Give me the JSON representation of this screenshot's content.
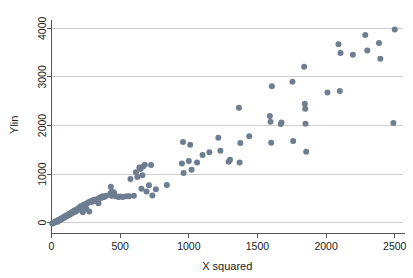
{
  "chart_data": {
    "type": "scatter",
    "title": "",
    "xlabel": "X squared",
    "ylabel": "Ylin",
    "xlim": [
      0,
      2560
    ],
    "ylim": [
      -120,
      4150
    ],
    "xticks": [
      0,
      500,
      1000,
      1500,
      2000,
      2500
    ],
    "yticks": [
      0,
      1000,
      2000,
      3000,
      4000
    ],
    "xtick_labels": [
      "0",
      "500",
      "1000",
      "1500",
      "2000",
      "2500"
    ],
    "ytick_labels": [
      "0",
      "1000",
      "2000",
      "3000",
      "4000"
    ],
    "grid": "horizontal",
    "legend": "none",
    "marker": "filled-circle",
    "marker_color": "#6e7d90",
    "marker_size": 3.0,
    "series": [
      {
        "name": "observations",
        "points": [
          [
            6,
            -15
          ],
          [
            12,
            -5
          ],
          [
            18,
            10
          ],
          [
            22,
            5
          ],
          [
            30,
            25
          ],
          [
            38,
            35
          ],
          [
            45,
            20
          ],
          [
            52,
            60
          ],
          [
            60,
            50
          ],
          [
            68,
            80
          ],
          [
            75,
            70
          ],
          [
            82,
            105
          ],
          [
            90,
            95
          ],
          [
            98,
            130
          ],
          [
            106,
            120
          ],
          [
            115,
            160
          ],
          [
            122,
            150
          ],
          [
            130,
            185
          ],
          [
            138,
            175
          ],
          [
            146,
            215
          ],
          [
            152,
            200
          ],
          [
            160,
            235
          ],
          [
            168,
            250
          ],
          [
            175,
            225
          ],
          [
            182,
            270
          ],
          [
            190,
            255
          ],
          [
            198,
            300
          ],
          [
            205,
            290
          ],
          [
            212,
            340
          ],
          [
            220,
            330
          ],
          [
            228,
            215
          ],
          [
            236,
            370
          ],
          [
            244,
            380
          ],
          [
            252,
            290
          ],
          [
            260,
            395
          ],
          [
            268,
            420
          ],
          [
            275,
            230
          ],
          [
            284,
            440
          ],
          [
            292,
            425
          ],
          [
            300,
            455
          ],
          [
            310,
            470
          ],
          [
            320,
            445
          ],
          [
            330,
            480
          ],
          [
            342,
            400
          ],
          [
            352,
            520
          ],
          [
            362,
            510
          ],
          [
            372,
            545
          ],
          [
            385,
            530
          ],
          [
            398,
            555
          ],
          [
            428,
            600
          ],
          [
            432,
            740
          ],
          [
            436,
            555
          ],
          [
            440,
            640
          ],
          [
            448,
            560
          ],
          [
            455,
            620
          ],
          [
            470,
            545
          ],
          [
            488,
            530
          ],
          [
            500,
            540
          ],
          [
            520,
            530
          ],
          [
            545,
            545
          ],
          [
            565,
            545
          ],
          [
            575,
            900
          ],
          [
            600,
            555
          ],
          [
            615,
            1035
          ],
          [
            625,
            940
          ],
          [
            640,
            1135
          ],
          [
            648,
            1105
          ],
          [
            655,
            700
          ],
          [
            662,
            975
          ],
          [
            668,
            1155
          ],
          [
            680,
            1190
          ],
          [
            692,
            640
          ],
          [
            710,
            770
          ],
          [
            725,
            1185
          ],
          [
            735,
            560
          ],
          [
            760,
            690
          ],
          [
            840,
            775
          ],
          [
            950,
            1220
          ],
          [
            958,
            1660
          ],
          [
            962,
            1020
          ],
          [
            1000,
            1270
          ],
          [
            1010,
            1605
          ],
          [
            1020,
            1090
          ],
          [
            1060,
            1240
          ],
          [
            1100,
            1395
          ],
          [
            1150,
            1450
          ],
          [
            1215,
            1745
          ],
          [
            1230,
            1480
          ],
          [
            1290,
            1255
          ],
          [
            1300,
            1295
          ],
          [
            1365,
            2365
          ],
          [
            1370,
            1240
          ],
          [
            1375,
            1640
          ],
          [
            1440,
            1780
          ],
          [
            1590,
            2195
          ],
          [
            1595,
            2075
          ],
          [
            1600,
            1645
          ],
          [
            1605,
            2805
          ],
          [
            1670,
            2030
          ],
          [
            1675,
            2060
          ],
          [
            1755,
            2900
          ],
          [
            1760,
            1680
          ],
          [
            1840,
            3210
          ],
          [
            1845,
            2445
          ],
          [
            1848,
            2345
          ],
          [
            1850,
            2035
          ],
          [
            1855,
            1460
          ],
          [
            2010,
            2680
          ],
          [
            2090,
            3670
          ],
          [
            2100,
            2710
          ],
          [
            2105,
            3490
          ],
          [
            2195,
            3455
          ],
          [
            2285,
            3860
          ],
          [
            2300,
            3545
          ],
          [
            2385,
            3695
          ],
          [
            2395,
            3375
          ],
          [
            2490,
            2050
          ],
          [
            2500,
            3975
          ]
        ]
      }
    ]
  },
  "axes": {
    "x_axis_name": "X squared",
    "y_axis_name": "Ylin"
  }
}
